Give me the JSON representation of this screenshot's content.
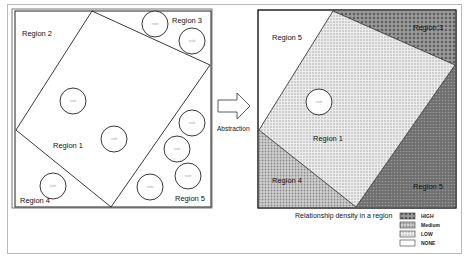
{
  "figure": {
    "left_panel": {
      "regions": [
        {
          "label": "Region 2",
          "x": 22,
          "y": 36
        },
        {
          "label": "Region 3",
          "x": 172,
          "y": 23
        },
        {
          "label": "Region 1",
          "x": 53,
          "y": 148
        },
        {
          "label": "Region 4",
          "x": 20,
          "y": 203
        },
        {
          "label": "Region 5",
          "x": 175,
          "y": 201
        }
      ],
      "circles": [
        {
          "cx": 155,
          "cy": 24,
          "r": 13,
          "label": "node"
        },
        {
          "cx": 192,
          "cy": 41,
          "r": 13,
          "label": "node"
        },
        {
          "cx": 73,
          "cy": 101,
          "r": 13,
          "label": "node"
        },
        {
          "cx": 114,
          "cy": 139,
          "r": 13,
          "label": "node"
        },
        {
          "cx": 192,
          "cy": 123,
          "r": 13,
          "label": "node"
        },
        {
          "cx": 177,
          "cy": 149,
          "r": 13,
          "label": "node"
        },
        {
          "cx": 188,
          "cy": 176,
          "r": 13,
          "label": "node"
        },
        {
          "cx": 150,
          "cy": 187,
          "r": 13,
          "label": "node"
        },
        {
          "cx": 53,
          "cy": 186,
          "r": 13,
          "label": "node"
        }
      ]
    },
    "arrow_label": "Abstraction",
    "right_panel": {
      "regions": [
        {
          "label": "Region 5",
          "x": 272,
          "y": 40
        },
        {
          "label": "Region 3",
          "x": 413,
          "y": 30
        },
        {
          "label": "Region 1",
          "x": 313,
          "y": 141
        },
        {
          "label": "Region 4",
          "x": 272,
          "y": 183
        },
        {
          "label": "Region 5",
          "x": 413,
          "y": 189
        }
      ],
      "circles": [
        {
          "cx": 319,
          "cy": 102,
          "r": 13,
          "label": "node"
        }
      ]
    },
    "caption": "Relationship density in a region",
    "legend": [
      {
        "label": "HIGH",
        "color": "#8a8a8a"
      },
      {
        "label": "Medium",
        "color": "#a6a6a6"
      },
      {
        "label": "LOW",
        "color": "#c8c8c8"
      },
      {
        "label": "NONE",
        "color": "#ffffff"
      }
    ],
    "colors": {
      "high": "#7f7f7f",
      "medium": "#a8a8a8",
      "low": "#c9c9c9",
      "none": "#ffffff",
      "line": "#222222"
    }
  }
}
